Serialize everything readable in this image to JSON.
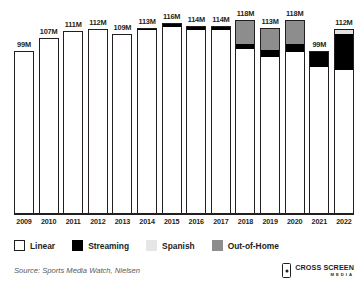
{
  "chart_data": {
    "type": "bar",
    "title": "",
    "subtitle": "",
    "xlabel": "",
    "ylabel": "",
    "grid": false,
    "stacked": true,
    "ylim": [
      0,
      125
    ],
    "categories": [
      "2009",
      "2010",
      "2011",
      "2012",
      "2013",
      "2014",
      "2015",
      "2016",
      "2017",
      "2018",
      "2019",
      "2020",
      "2021",
      "2022"
    ],
    "data_labels": [
      "99M",
      "107M",
      "111M",
      "112M",
      "109M",
      "113M",
      "116M",
      "114M",
      "114M",
      "118M",
      "113M",
      "118M",
      "99M",
      "112M"
    ],
    "totals": [
      99,
      107,
      111,
      112,
      109,
      113,
      116,
      114,
      114,
      118,
      113,
      118,
      99,
      112
    ],
    "series": [
      {
        "name": "Linear",
        "color": "#ffffff",
        "values": [
          99,
          107,
          111,
          112,
          109,
          112,
          114,
          112,
          112,
          101,
          96,
          99,
          90,
          88
        ]
      },
      {
        "name": "Streaming",
        "color": "#000000",
        "values": [
          0,
          0,
          0,
          0,
          0,
          1,
          2,
          2,
          2,
          3,
          4,
          5,
          9,
          22
        ]
      },
      {
        "name": "Spanish",
        "color": "#e2e2e2",
        "values": [
          0,
          0,
          0,
          0,
          0,
          0,
          0,
          0,
          0,
          0,
          0,
          0,
          0,
          2
        ]
      },
      {
        "name": "Out-of-Home",
        "color": "#8d8d8d",
        "values": [
          0,
          0,
          0,
          0,
          0,
          0,
          0,
          0,
          0,
          14,
          13,
          14,
          0,
          0
        ]
      }
    ],
    "legend_position": "bottom-left",
    "source": "Source: Sports Media Watch, Nielsen"
  },
  "legend": {
    "items": [
      {
        "label": "Linear",
        "swatch": "linear"
      },
      {
        "label": "Streaming",
        "swatch": "streaming"
      },
      {
        "label": "Spanish",
        "swatch": "spanish"
      },
      {
        "label": "Out-of-Home",
        "swatch": "out-of-home"
      }
    ]
  },
  "footer": {
    "source": "Source: Sports Media Watch, Nielsen",
    "logo_top": "CROSS SCREEN",
    "logo_bottom": "MEDIA"
  }
}
